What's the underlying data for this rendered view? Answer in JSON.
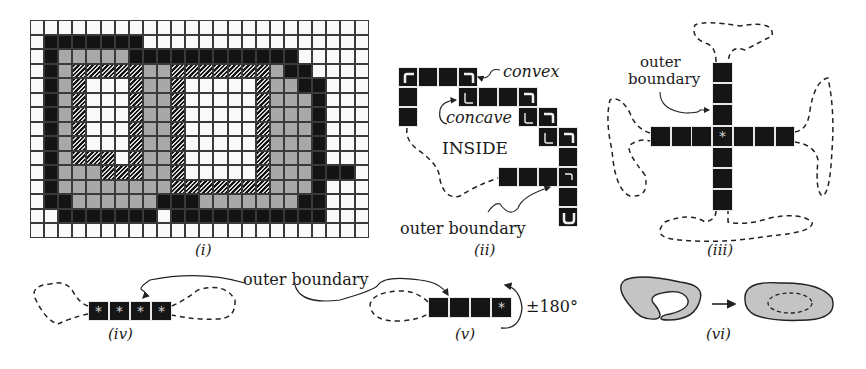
{
  "figure": {
    "panels": [
      {
        "id": "i",
        "caption": "(i)"
      },
      {
        "id": "ii",
        "caption": "(ii)"
      },
      {
        "id": "iii",
        "caption": "(iii)"
      },
      {
        "id": "iv",
        "caption": "(iv)"
      },
      {
        "id": "v",
        "caption": "(v)"
      },
      {
        "id": "vi",
        "caption": "(vi)"
      }
    ]
  },
  "panel_i": {
    "caption": "(i)",
    "columns": 24,
    "rows": 15,
    "legend_codes": {
      "W": "empty cell",
      "B": "black (boundary) cell",
      "G": "gray cell",
      "H": "hatched cell"
    },
    "grid": [
      "WWWWWWWWWWWWWWWWWWWWWWWW",
      "WBBBBBBBWWWWWWWWWWWWWWWW",
      "WBGGGGGBBBBBBBBBBBBWWWWW",
      "WBGHHHHHGGHHHHHHHGBBWWWW",
      "WBGHWWWHGGHWWWWWHGGBBWWW",
      "WBGHWWWHGGHWWWWWHGGGBWWW",
      "WBGHWWWHGGHWWWWWHGGGBWWW",
      "WBGHWWWHGGHWWWWWHGGGBWWW",
      "WBGHWWWHGGHWWWWWHGGGBWWW",
      "WBGHHHWHGGHWWWWWHGGGBWWW",
      "WBGGGHHHGGHWWWWWHGGGBBBW",
      "WBGGGGGGGGHHHHHHHGGGBWWW",
      "WBBGGGGGGBBBGGGGGGGBBWWW",
      "WWBBBBBBBWBBBBBBBBBBBWWW",
      "WWWWWWWWWWWWWWWWWWWWWWWW"
    ]
  },
  "panel_ii": {
    "caption": "(ii)",
    "label_convex": "convex",
    "label_concave": "concave",
    "label_inside": "INSIDE",
    "label_outer": "outer boundary"
  },
  "panel_iii": {
    "caption": "(iii)",
    "label_outer_line1": "outer",
    "label_outer_line2": "boundary",
    "center_mark": "*"
  },
  "panel_iv": {
    "caption": "(iv)",
    "cells": [
      "*",
      "*",
      "*",
      "*"
    ]
  },
  "panel_v": {
    "caption": "(v)",
    "cells": [
      "",
      "",
      "",
      "*"
    ],
    "rotation_label": "±180°"
  },
  "shared": {
    "outer_boundary_label": "outer boundary"
  },
  "panel_vi": {
    "caption": "(vi)"
  }
}
